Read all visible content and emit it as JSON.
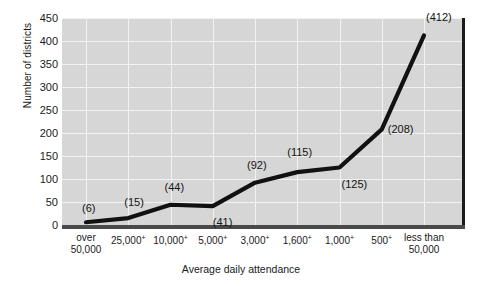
{
  "chart_data": {
    "type": "line",
    "title": "",
    "xlabel": "Average daily attendance",
    "ylabel": "Number of districts",
    "categories": [
      "over 50,000",
      "25,000+",
      "10,000+",
      "5,000+",
      "3,000+",
      "1,600+",
      "1,000+",
      "500+",
      "less than 50,000"
    ],
    "category_lines": [
      [
        "over",
        "50,000"
      ],
      [
        "25,000",
        "+"
      ],
      [
        "10,000",
        "+"
      ],
      [
        "5,000",
        "+"
      ],
      [
        "3,000",
        "+"
      ],
      [
        "1,600",
        "+"
      ],
      [
        "1,000",
        "+"
      ],
      [
        "500",
        "+"
      ],
      [
        "less than",
        "50,000"
      ]
    ],
    "values": [
      6,
      15,
      44,
      41,
      92,
      115,
      125,
      208,
      412
    ],
    "point_labels": [
      "(6)",
      "(15)",
      "(44)",
      "(41)",
      "(92)",
      "(115)",
      "(125)",
      "(208)",
      "(412)"
    ],
    "ylim": [
      0,
      450
    ],
    "yticks": [
      0,
      50,
      100,
      150,
      200,
      250,
      300,
      350,
      400,
      450
    ],
    "ytick_labels": [
      "0",
      "50",
      "100",
      "150",
      "200",
      "250",
      "300",
      "350",
      "400",
      "450"
    ],
    "grid": true,
    "legend": "none",
    "colors": {
      "plot_background": "#d6d6d6",
      "gridline": "#f2f2f2",
      "series_line": "#111111",
      "baseline": "#4a4a4a",
      "right_border": "#1b1b1b",
      "text": "#141414",
      "page_background": "#ffffff"
    }
  }
}
